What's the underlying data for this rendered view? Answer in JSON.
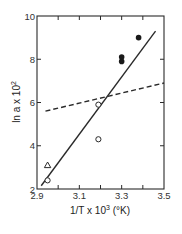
{
  "chart_data": {
    "type": "scatter",
    "title": "",
    "xlabel": "1/T x 10^3 (°K)",
    "ylabel": "ln a x 10^2",
    "xlim": [
      2.9,
      3.5
    ],
    "ylim": [
      2,
      10
    ],
    "x_ticks": [
      2.9,
      3.1,
      3.3,
      3.5
    ],
    "x_tick_labels": [
      "2.9",
      "3.1",
      "3.3",
      "3.5"
    ],
    "x_minor_ticks": [
      3.0,
      3.2,
      3.4
    ],
    "y_ticks": [
      2,
      4,
      6,
      8,
      10
    ],
    "y_tick_labels": [
      "2",
      "4",
      "6",
      "8",
      "10"
    ],
    "grid": false,
    "legend": null,
    "series": [
      {
        "name": "open circles",
        "marker": "open-circle",
        "points": [
          [
            2.95,
            2.4
          ],
          [
            3.19,
            5.9
          ],
          [
            3.19,
            4.3
          ]
        ]
      },
      {
        "name": "filled circles",
        "marker": "filled-circle",
        "points": [
          [
            3.3,
            7.9
          ],
          [
            3.3,
            8.1
          ],
          [
            3.38,
            9.0
          ]
        ]
      },
      {
        "name": "triangle",
        "marker": "open-triangle",
        "points": [
          [
            2.95,
            3.1
          ]
        ]
      }
    ],
    "lines": [
      {
        "name": "solid fit",
        "style": "solid",
        "from": [
          2.92,
          2.15
        ],
        "to": [
          3.46,
          9.3
        ]
      },
      {
        "name": "dashed fit",
        "style": "dashed",
        "from": [
          2.94,
          5.6
        ],
        "to": [
          3.5,
          6.9
        ]
      }
    ]
  },
  "labels": {
    "y_axis_prefix": "ln a x 10",
    "y_axis_exp": "2",
    "x_axis_prefix": "1/T x 10",
    "x_axis_exp": "3",
    "x_axis_suffix": " (°K)"
  }
}
